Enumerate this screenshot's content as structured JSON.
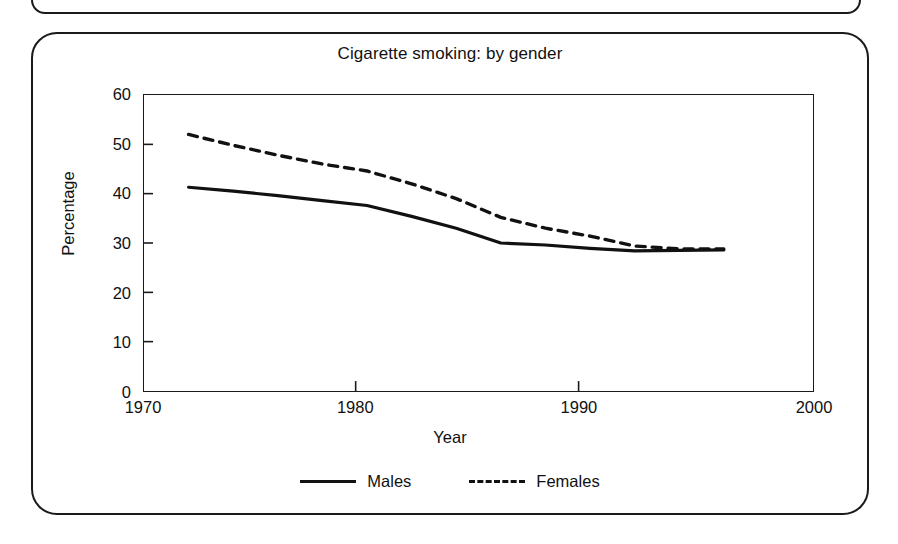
{
  "figure": {
    "title": "Cigarette smoking: by gender"
  },
  "chart_data": {
    "type": "line",
    "title": "Cigarette smoking: by gender",
    "xlabel": "Year",
    "ylabel": "Percentage",
    "xlim": [
      1970,
      2000
    ],
    "ylim": [
      0,
      60
    ],
    "xticks": [
      "1970",
      "1980",
      "1990",
      "2000"
    ],
    "yticks": [
      "0",
      "10",
      "20",
      "30",
      "40",
      "50",
      "60"
    ],
    "grid": false,
    "legend_position": "bottom",
    "x": [
      1972,
      1974,
      1976,
      1978,
      1980,
      1982,
      1984,
      1986,
      1988,
      1990,
      1992,
      1994,
      1996
    ],
    "series": [
      {
        "name": "Males",
        "style": "solid",
        "color": "#111111",
        "values": [
          41.3,
          40.5,
          39.6,
          38.6,
          37.6,
          35.4,
          33.0,
          30.0,
          29.6,
          28.9,
          28.4,
          28.5,
          28.6
        ]
      },
      {
        "name": "Females",
        "style": "dashed",
        "color": "#111111",
        "values": [
          52.0,
          49.8,
          47.8,
          46.0,
          44.6,
          42.0,
          39.0,
          35.2,
          33.0,
          31.4,
          29.4,
          28.8,
          28.8
        ]
      }
    ]
  },
  "legend": {
    "items": [
      {
        "label": "Males",
        "style": "solid"
      },
      {
        "label": "Females",
        "style": "dashed"
      }
    ]
  }
}
